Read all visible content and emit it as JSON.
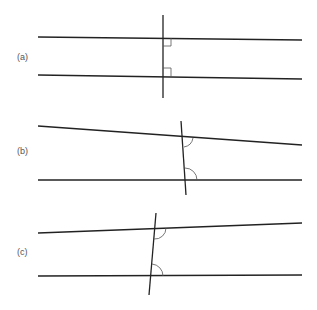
{
  "diagram": {
    "title": "",
    "line_color": "#222222",
    "mark_color": "#444444",
    "panels": [
      {
        "label": "(a)",
        "label_pos": [
          17,
          52
        ],
        "line1": [
          38,
          37,
          302,
          40
        ],
        "line2": [
          38,
          75,
          302,
          79
        ],
        "transversal": [
          163,
          15,
          163,
          98
        ],
        "marks": "right-angle"
      },
      {
        "label": "(b)",
        "label_pos": [
          17,
          146
        ],
        "line1": [
          38,
          126,
          302,
          145
        ],
        "line2": [
          38,
          180,
          302,
          180
        ],
        "transversal": [
          181,
          121,
          186,
          195
        ],
        "marks": "arc"
      },
      {
        "label": "(c)",
        "label_pos": [
          17,
          247
        ],
        "line1": [
          38,
          233,
          302,
          223
        ],
        "line2": [
          38,
          276,
          302,
          275
        ],
        "transversal": [
          156,
          213,
          149,
          295
        ],
        "marks": "arc"
      }
    ]
  }
}
